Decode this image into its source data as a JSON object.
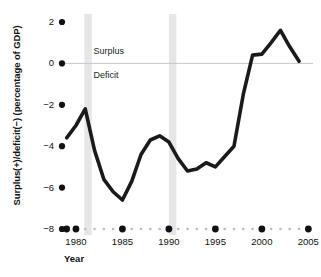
{
  "chart_data": {
    "type": "line",
    "title": "",
    "xlabel": "Year",
    "ylabel": "Surplus(+)/deficit(−) (percentage of GDP)",
    "xlim": [
      1978.5,
      2005.5
    ],
    "ylim": [
      -8,
      2.6
    ],
    "grid": false,
    "legend": "none",
    "y_ticks": [
      "2",
      "0",
      "−2",
      "−4",
      "−6",
      "−8"
    ],
    "y_tick_values": [
      2,
      0,
      -2,
      -4,
      -6,
      -8
    ],
    "x_ticks": [
      "1980",
      "1985",
      "1990",
      "1995",
      "2000",
      "2005"
    ],
    "x_tick_values": [
      1980,
      1985,
      1990,
      1995,
      2000,
      2005
    ],
    "zero_line": 0,
    "annotations": [
      {
        "text": "Surplus",
        "x": 1981.9,
        "y": 0.55
      },
      {
        "text": "Deficit",
        "x": 1981.9,
        "y": -0.62
      }
    ],
    "shaded_bands": [
      {
        "label": "recession",
        "start": 1980.9,
        "end": 1981.7,
        "color": "#e6e6e6"
      },
      {
        "label": "recession",
        "start": 1990.0,
        "end": 1990.8,
        "color": "#e6e6e6"
      }
    ],
    "series": [
      {
        "name": "Federal surplus/deficit",
        "color": "#1a1a1a",
        "x": [
          1979,
          1980,
          1981,
          1982,
          1983,
          1984,
          1985,
          1986,
          1987,
          1988,
          1989,
          1990,
          1991,
          1992,
          1993,
          1994,
          1995,
          1996,
          1997,
          1998,
          1999,
          2000,
          2001,
          2002,
          2003,
          2004
        ],
        "values": [
          -3.6,
          -3.0,
          -2.2,
          -4.2,
          -5.6,
          -6.2,
          -6.6,
          -5.7,
          -4.4,
          -3.7,
          -3.5,
          -3.8,
          -4.6,
          -5.2,
          -5.1,
          -4.8,
          -5.0,
          -4.5,
          -4.0,
          -1.5,
          0.4,
          0.45,
          1.0,
          1.6,
          0.8,
          0.1
        ]
      }
    ],
    "series_note": "line traced from plotted curve"
  },
  "axis_markers": {
    "y_dot_color": "#111111",
    "x_major_dot_color": "#111111",
    "x_minor_dot_color": "#bbbbbb"
  }
}
